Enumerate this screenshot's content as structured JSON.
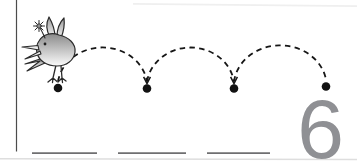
{
  "worksheet": {
    "numeral": "6",
    "numeral_color": "#8f9094",
    "background": "#ffffff",
    "illustration": "hopping-bird-with-flower",
    "hop_arc_count": 3,
    "dot_count": 4,
    "writing_line_count": 3,
    "colors": {
      "arc": "#161616",
      "dot": "#121212",
      "writing_line": "#6f6f71",
      "margin_line": "#4c4c4c",
      "page_edge": "#e6e6e6",
      "bird_outline": "#2b2b2b"
    }
  }
}
